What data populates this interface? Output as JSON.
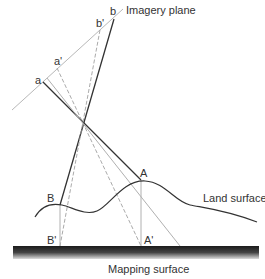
{
  "labels": {
    "imagery_plane": "Imagery plane",
    "land_surface": "Land surface",
    "mapping_surface": "Mapping surface",
    "point_a": "a",
    "point_a_prime": "a'",
    "point_b": "b",
    "point_b_prime": "b'",
    "point_A": "A",
    "point_A_prime": "A'",
    "point_B": "B",
    "point_B_prime": "B'"
  },
  "colors": {
    "solid_line": "#333333",
    "light_line": "#b0b0b0",
    "dashed_line": "#a0a0a0",
    "text": "#333333",
    "surface_dark": "#1a1a1a",
    "surface_light": "#d8d8d8"
  }
}
